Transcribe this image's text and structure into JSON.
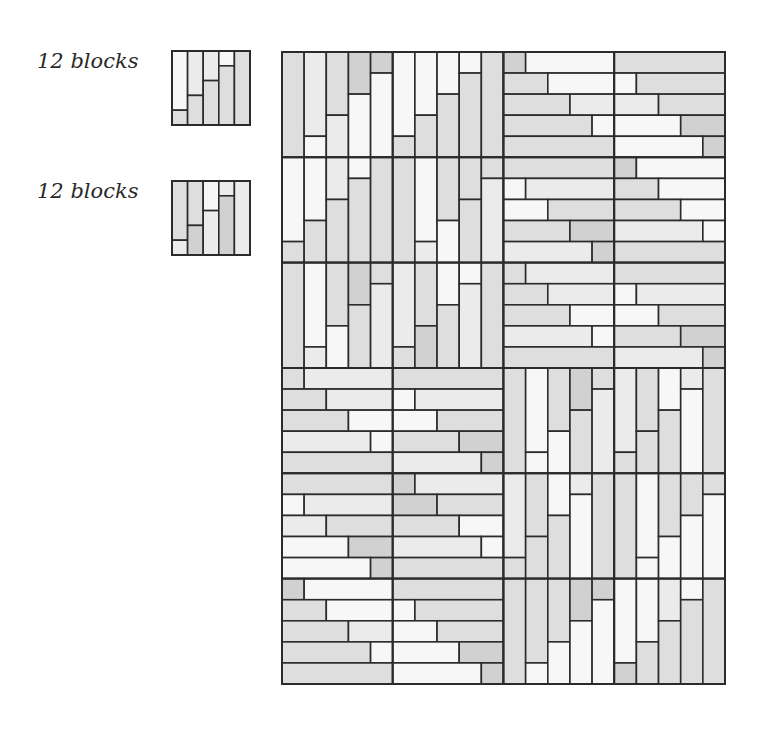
{
  "legend": [
    {
      "label": "12 blocks",
      "box": {
        "x": 172,
        "y": 51,
        "w": 78,
        "h": 74
      },
      "block": {
        "o": "v",
        "s": [
          [
            4,
            "W",
            "M"
          ],
          [
            3,
            "L",
            "M"
          ],
          [
            2,
            "L",
            "M"
          ],
          [
            1,
            "W",
            "M"
          ],
          [
            0,
            "M",
            "M"
          ]
        ]
      }
    },
    {
      "label": "12 blocks",
      "box": {
        "x": 172,
        "y": 181,
        "w": 78,
        "h": 74
      },
      "block": {
        "o": "v",
        "s": [
          [
            4,
            "M",
            "L"
          ],
          [
            3,
            "M",
            "D"
          ],
          [
            2,
            "W",
            "L"
          ],
          [
            1,
            "L",
            "D"
          ],
          [
            0,
            "L",
            "L"
          ]
        ]
      }
    }
  ],
  "shades": {
    "W": "#f7f7f7",
    "L": "#ebebeb",
    "M": "#dedede",
    "D": "#d1d1d1"
  },
  "grid": {
    "x": 282,
    "y": 52,
    "w": 443,
    "h": 632,
    "cols": 4,
    "rows": 6,
    "units": 5,
    "stroke": "#2b2b2b",
    "blocks": [
      [
        {
          "o": "v",
          "s": [
            [
              0,
              "M",
              "M"
            ],
            [
              4,
              "L",
              "W"
            ],
            [
              3,
              "M",
              "L"
            ],
            [
              2,
              "D",
              "W"
            ],
            [
              1,
              "D",
              "W"
            ]
          ]
        },
        {
          "o": "v",
          "s": [
            [
              4,
              "W",
              "M"
            ],
            [
              3,
              "W",
              "M"
            ],
            [
              2,
              "W",
              "M"
            ],
            [
              1,
              "W",
              "M"
            ],
            [
              0,
              "M",
              "M"
            ]
          ]
        },
        {
          "o": "h",
          "s": [
            [
              1,
              "D",
              "W"
            ],
            [
              2,
              "M",
              "W"
            ],
            [
              3,
              "M",
              "L"
            ],
            [
              4,
              "M",
              "W"
            ],
            [
              0,
              "M",
              "M"
            ]
          ]
        },
        {
          "o": "h",
          "s": [
            [
              0,
              "M",
              "M"
            ],
            [
              1,
              "W",
              "M"
            ],
            [
              2,
              "L",
              "M"
            ],
            [
              3,
              "W",
              "D"
            ],
            [
              4,
              "W",
              "D"
            ]
          ]
        }
      ],
      [
        {
          "o": "v",
          "s": [
            [
              4,
              "W",
              "M"
            ],
            [
              3,
              "W",
              "M"
            ],
            [
              2,
              "L",
              "M"
            ],
            [
              1,
              "W",
              "M"
            ],
            [
              0,
              "M",
              "M"
            ]
          ]
        },
        {
          "o": "v",
          "s": [
            [
              0,
              "M",
              "M"
            ],
            [
              4,
              "W",
              "L"
            ],
            [
              3,
              "M",
              "W"
            ],
            [
              2,
              "M",
              "M"
            ],
            [
              1,
              "M",
              "L"
            ]
          ]
        },
        {
          "o": "h",
          "s": [
            [
              0,
              "M",
              "M"
            ],
            [
              1,
              "W",
              "L"
            ],
            [
              2,
              "W",
              "M"
            ],
            [
              3,
              "M",
              "D"
            ],
            [
              4,
              "L",
              "D"
            ]
          ]
        },
        {
          "o": "h",
          "s": [
            [
              1,
              "D",
              "W"
            ],
            [
              2,
              "M",
              "W"
            ],
            [
              3,
              "M",
              "W"
            ],
            [
              4,
              "L",
              "W"
            ],
            [
              0,
              "M",
              "M"
            ]
          ]
        }
      ],
      [
        {
          "o": "v",
          "s": [
            [
              0,
              "M",
              "M"
            ],
            [
              4,
              "W",
              "L"
            ],
            [
              3,
              "M",
              "W"
            ],
            [
              2,
              "D",
              "M"
            ],
            [
              1,
              "M",
              "L"
            ]
          ]
        },
        {
          "o": "v",
          "s": [
            [
              4,
              "L",
              "M"
            ],
            [
              3,
              "M",
              "D"
            ],
            [
              2,
              "W",
              "M"
            ],
            [
              1,
              "W",
              "L"
            ],
            [
              0,
              "M",
              "M"
            ]
          ]
        },
        {
          "o": "h",
          "s": [
            [
              1,
              "M",
              "L"
            ],
            [
              2,
              "M",
              "L"
            ],
            [
              3,
              "M",
              "W"
            ],
            [
              4,
              "L",
              "W"
            ],
            [
              0,
              "M",
              "M"
            ]
          ]
        },
        {
          "o": "h",
          "s": [
            [
              0,
              "M",
              "M"
            ],
            [
              1,
              "W",
              "L"
            ],
            [
              2,
              "W",
              "M"
            ],
            [
              3,
              "M",
              "D"
            ],
            [
              4,
              "L",
              "D"
            ]
          ]
        }
      ],
      [
        {
          "o": "h",
          "s": [
            [
              1,
              "M",
              "L"
            ],
            [
              2,
              "M",
              "L"
            ],
            [
              3,
              "M",
              "W"
            ],
            [
              4,
              "L",
              "W"
            ],
            [
              0,
              "M",
              "M"
            ]
          ]
        },
        {
          "o": "h",
          "s": [
            [
              0,
              "M",
              "M"
            ],
            [
              1,
              "W",
              "L"
            ],
            [
              2,
              "W",
              "M"
            ],
            [
              3,
              "M",
              "D"
            ],
            [
              4,
              "L",
              "D"
            ]
          ]
        },
        {
          "o": "v",
          "s": [
            [
              0,
              "M",
              "M"
            ],
            [
              4,
              "W",
              "W"
            ],
            [
              3,
              "M",
              "W"
            ],
            [
              2,
              "D",
              "M"
            ],
            [
              1,
              "M",
              "L"
            ]
          ]
        },
        {
          "o": "v",
          "s": [
            [
              4,
              "L",
              "M"
            ],
            [
              3,
              "M",
              "M"
            ],
            [
              2,
              "W",
              "M"
            ],
            [
              1,
              "L",
              "W"
            ],
            [
              0,
              "M",
              "M"
            ]
          ]
        }
      ],
      [
        {
          "o": "h",
          "s": [
            [
              0,
              "M",
              "M"
            ],
            [
              1,
              "W",
              "L"
            ],
            [
              2,
              "L",
              "M"
            ],
            [
              3,
              "W",
              "D"
            ],
            [
              4,
              "W",
              "D"
            ]
          ]
        },
        {
          "o": "h",
          "s": [
            [
              1,
              "D",
              "L"
            ],
            [
              2,
              "D",
              "M"
            ],
            [
              3,
              "M",
              "W"
            ],
            [
              4,
              "L",
              "W"
            ],
            [
              0,
              "M",
              "M"
            ]
          ]
        },
        {
          "o": "v",
          "s": [
            [
              4,
              "L",
              "M"
            ],
            [
              3,
              "M",
              "M"
            ],
            [
              2,
              "W",
              "M"
            ],
            [
              1,
              "L",
              "W"
            ],
            [
              0,
              "M",
              "M"
            ]
          ]
        },
        {
          "o": "v",
          "s": [
            [
              0,
              "M",
              "M"
            ],
            [
              4,
              "W",
              "W"
            ],
            [
              3,
              "M",
              "W"
            ],
            [
              2,
              "M",
              "W"
            ],
            [
              1,
              "M",
              "W"
            ]
          ]
        }
      ],
      [
        {
          "o": "h",
          "s": [
            [
              1,
              "D",
              "W"
            ],
            [
              2,
              "M",
              "W"
            ],
            [
              3,
              "M",
              "L"
            ],
            [
              4,
              "M",
              "W"
            ],
            [
              0,
              "M",
              "M"
            ]
          ]
        },
        {
          "o": "h",
          "s": [
            [
              0,
              "M",
              "M"
            ],
            [
              1,
              "W",
              "M"
            ],
            [
              2,
              "W",
              "M"
            ],
            [
              3,
              "W",
              "D"
            ],
            [
              4,
              "W",
              "D"
            ]
          ]
        },
        {
          "o": "v",
          "s": [
            [
              0,
              "M",
              "M"
            ],
            [
              4,
              "M",
              "W"
            ],
            [
              3,
              "M",
              "W"
            ],
            [
              2,
              "D",
              "W"
            ],
            [
              1,
              "D",
              "W"
            ]
          ]
        },
        {
          "o": "v",
          "s": [
            [
              4,
              "W",
              "D"
            ],
            [
              3,
              "W",
              "M"
            ],
            [
              2,
              "L",
              "M"
            ],
            [
              1,
              "W",
              "M"
            ],
            [
              0,
              "M",
              "M"
            ]
          ]
        }
      ]
    ]
  }
}
